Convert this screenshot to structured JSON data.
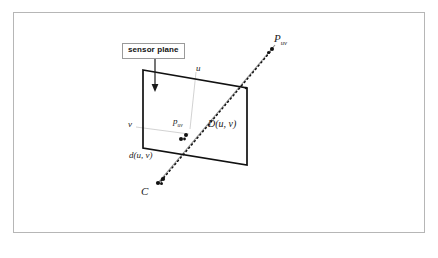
{
  "figure": {
    "callout": {
      "text": "sensor plane",
      "arrow": "down-arrow-icon"
    },
    "labels": {
      "scene_point": {
        "base": "P",
        "sub": "uv"
      },
      "camera_center": "C",
      "image_point": {
        "base": "p",
        "sub": "uv"
      },
      "scene_distance": "D(u, v)",
      "image_distance": "d(u, v)",
      "axis_u": "u",
      "axis_v": "v"
    },
    "colors": {
      "frame_border": "#b6b6b6",
      "plane_outline": "#111111",
      "ray_line": "#8d8d8d",
      "dotted_ray": "#111111",
      "axis_guide": "#c9c9c9",
      "callout_border": "#9a9a9a",
      "background": "#ffffff"
    },
    "geometry": {
      "plane_quad": [
        [
          143,
          70
        ],
        [
          247,
          88
        ],
        [
          247,
          165
        ],
        [
          143,
          148
        ]
      ],
      "camera_center_point": [
        160,
        181
      ],
      "image_point": [
        184,
        137
      ],
      "scene_point": [
        272,
        47
      ],
      "plane_intersection": [
        246,
        88
      ],
      "u_guide": [
        [
          196,
          72
        ],
        [
          190,
          128
        ]
      ],
      "v_guide": [
        [
          136,
          127
        ],
        [
          188,
          133
        ]
      ],
      "callout_arrow": [
        [
          155,
          60
        ],
        [
          155,
          91
        ]
      ]
    }
  }
}
